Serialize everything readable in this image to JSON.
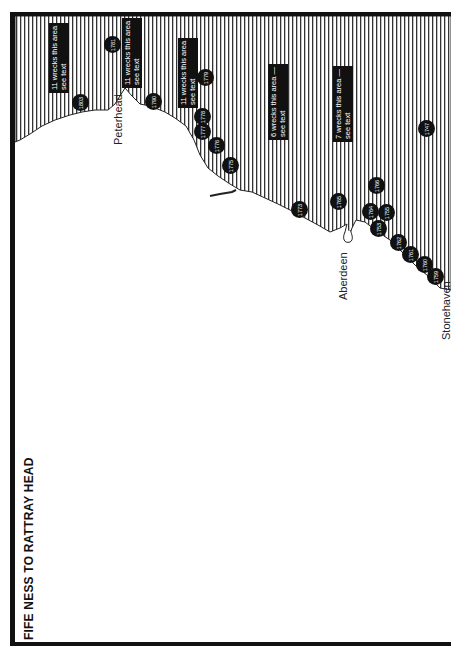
{
  "map": {
    "title": "FIFE NESS TO RATTRAY HEAD",
    "orientation": "rotated 90° counter-clockwise",
    "colors": {
      "sea_hatch": "#222222",
      "land": "#ffffff",
      "frame": "#111111",
      "marker": "#111111",
      "marker_text": "#ffffff"
    },
    "places": [
      {
        "name": "Peterhead"
      },
      {
        "name": "Aberdeen"
      },
      {
        "name": "Stonehaven"
      }
    ],
    "notes": [
      {
        "text1": "11 wrecks this area",
        "text2": "see text"
      },
      {
        "text1": "11 wrecks this area",
        "text2": "see text"
      },
      {
        "text1": "11 wrecks this area",
        "text2": "see text"
      },
      {
        "text1": "6 wrecks this area —",
        "text2": "see text"
      },
      {
        "text1": "7 wrecks this area —",
        "text2": "see text"
      }
    ],
    "wrecks": [
      {
        "year": "1803"
      },
      {
        "year": "1781"
      },
      {
        "year": "1790"
      },
      {
        "year": "1779"
      },
      {
        "year": "1778"
      },
      {
        "year": "1777"
      },
      {
        "year": "1776"
      },
      {
        "year": "1775"
      },
      {
        "year": "1773"
      },
      {
        "year": "1765"
      },
      {
        "year": "1766"
      },
      {
        "year": "1764"
      },
      {
        "year": "1753"
      },
      {
        "year": "1755"
      },
      {
        "year": "1762"
      },
      {
        "year": "1761"
      },
      {
        "year": "1760"
      },
      {
        "year": "1759"
      },
      {
        "year": "1747"
      }
    ]
  }
}
